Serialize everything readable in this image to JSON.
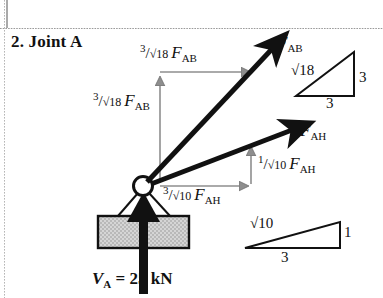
{
  "page": {
    "background": "#ffffff",
    "ink": "#111111",
    "gray_component": "#8e8e8e",
    "block_fill": "#b9b9b9",
    "divider_color": "#9a9a9a"
  },
  "title": "2. Joint A",
  "labels": {
    "fab_horizontal": {
      "num": "3",
      "slash": "/",
      "den": "√18",
      "force": "F",
      "force_sub": "AB"
    },
    "fab_vertical": {
      "num": "3",
      "slash": "/",
      "den": "√18",
      "force": "F",
      "force_sub": "AB"
    },
    "fah_vertical": {
      "num": "1",
      "slash": "/",
      "den": "√10",
      "force": "F",
      "force_sub": "AH"
    },
    "fah_horizontal": {
      "num": "3",
      "slash": "/",
      "den": "√10",
      "force": "F",
      "force_sub": "AH"
    },
    "force_ab": {
      "force": "F",
      "sub": "AB"
    },
    "force_ah": {
      "force": "F",
      "sub": "AH"
    }
  },
  "triangles": {
    "upper": {
      "hypotenuse": "√18",
      "vertical": "3",
      "base": "3"
    },
    "lower": {
      "hypotenuse": "√10",
      "vertical": "1",
      "base": "3"
    }
  },
  "reaction": {
    "symbol": "V",
    "sub": "A",
    "equals": "= 25 kN"
  },
  "diagram": {
    "joint": {
      "name": "pin-joint-A",
      "cx": 143,
      "cy": 186,
      "r": 9
    },
    "vectors": [
      {
        "name": "force-ab-vector",
        "x1": 143,
        "y1": 186,
        "x2": 276,
        "y2": 44,
        "style": "solid-black-bold"
      },
      {
        "name": "force-ah-vector",
        "x1": 143,
        "y1": 186,
        "x2": 297,
        "y2": 127,
        "style": "solid-black-bold"
      },
      {
        "name": "reaction-va-vector",
        "x1": 143,
        "y1": 292,
        "x2": 143,
        "y2": 200,
        "style": "solid-black-bold"
      }
    ],
    "components": [
      {
        "name": "fab-horizontal-component",
        "orientation": "horizontal",
        "x1": 160,
        "y1": 72,
        "x2": 248,
        "y2": 72
      },
      {
        "name": "fab-vertical-component",
        "orientation": "vertical",
        "x1": 160,
        "y1": 182,
        "x2": 160,
        "y2": 80
      },
      {
        "name": "fah-horizontal-component",
        "orientation": "horizontal",
        "x1": 160,
        "y1": 186,
        "x2": 246,
        "y2": 186
      },
      {
        "name": "fah-vertical-component",
        "orientation": "vertical",
        "x1": 251,
        "y1": 184,
        "x2": 251,
        "y2": 150
      }
    ]
  }
}
